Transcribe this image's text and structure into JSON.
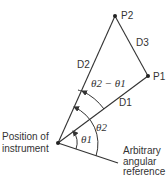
{
  "points": {
    "origin": {
      "x": 58,
      "y": 143
    },
    "p1": {
      "x": 148,
      "y": 76,
      "label": "P1"
    },
    "p2": {
      "x": 115,
      "y": 16,
      "label": "P2"
    },
    "ref_end": {
      "x": 118,
      "y": 163
    }
  },
  "labels": {
    "p1": "P1",
    "p2": "P2",
    "d1": "D1",
    "d2": "D2",
    "d3": "D3",
    "theta1": "θ1",
    "theta2": "θ2",
    "theta_diff": "θ2 − θ1",
    "instrument_line1": "Position of",
    "instrument_line2": "instrument",
    "reference_line1": "Arbitrary",
    "reference_line2": "angular",
    "reference_line3": "reference"
  },
  "colors": {
    "line": "#333333",
    "text": "#333333"
  }
}
